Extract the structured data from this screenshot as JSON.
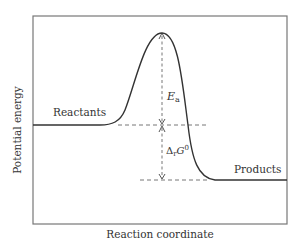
{
  "diagram": {
    "type": "reaction-energy-profile",
    "x_axis_label": "Reaction coordinate",
    "y_axis_label": "Potential energy",
    "labels": {
      "reactants": "Reactants",
      "products": "Products",
      "activation_energy_symbol": "E",
      "activation_energy_subscript": "a",
      "delta_symbol": "Δ",
      "delta_subscript": "r",
      "delta_main": "G",
      "delta_superscript": "0"
    },
    "colors": {
      "frame": "#777777",
      "curve": "#333333",
      "dashed": "#777777",
      "text": "#333333"
    }
  }
}
